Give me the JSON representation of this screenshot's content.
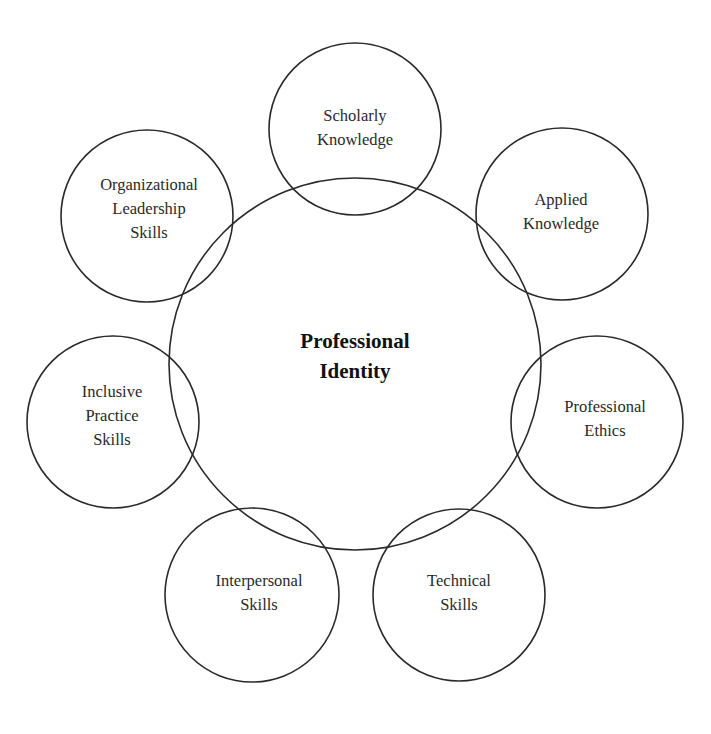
{
  "diagram": {
    "type": "concept-map",
    "stroke_color": "#2a2a2a",
    "background": "#ffffff",
    "center": {
      "label_lines": [
        "Professional",
        "Identity"
      ],
      "cx": 355,
      "cy": 364,
      "r": 186,
      "label_x": 355,
      "label_y": 356
    },
    "nodes": [
      {
        "id": "scholarly-knowledge",
        "label_lines": [
          "Scholarly",
          "Knowledge"
        ],
        "cx": 355,
        "cy": 129,
        "r": 86,
        "label_x": 355,
        "label_y": 128
      },
      {
        "id": "applied-knowledge",
        "label_lines": [
          "Applied",
          "Knowledge"
        ],
        "cx": 562,
        "cy": 214,
        "r": 86,
        "label_x": 561,
        "label_y": 212
      },
      {
        "id": "professional-ethics",
        "label_lines": [
          "Professional",
          "Ethics"
        ],
        "cx": 597,
        "cy": 422,
        "r": 86,
        "label_x": 605,
        "label_y": 419
      },
      {
        "id": "technical-skills",
        "label_lines": [
          "Technical",
          "Skills"
        ],
        "cx": 459,
        "cy": 595,
        "r": 86,
        "label_x": 459,
        "label_y": 593
      },
      {
        "id": "interpersonal-skills",
        "label_lines": [
          "Interpersonal",
          "Skills"
        ],
        "cx": 252,
        "cy": 595,
        "r": 87,
        "label_x": 259,
        "label_y": 593
      },
      {
        "id": "inclusive-practice-skills",
        "label_lines": [
          "Inclusive",
          "Practice",
          "Skills"
        ],
        "cx": 113,
        "cy": 422,
        "r": 86,
        "label_x": 112,
        "label_y": 416
      },
      {
        "id": "organizational-leadership-skills",
        "label_lines": [
          "Organizational",
          "Leadership",
          "Skills"
        ],
        "cx": 147,
        "cy": 216,
        "r": 86,
        "label_x": 149,
        "label_y": 209
      }
    ]
  }
}
